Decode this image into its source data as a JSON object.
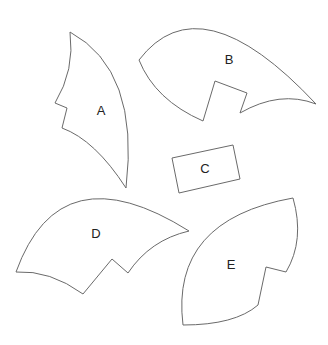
{
  "diagram": {
    "shapes": [
      {
        "id": "A",
        "label": "A",
        "label_pos": [
          101,
          110
        ]
      },
      {
        "id": "B",
        "label": "B",
        "label_pos": [
          229,
          59
        ]
      },
      {
        "id": "C",
        "label": "C",
        "label_pos": [
          205,
          168
        ]
      },
      {
        "id": "D",
        "label": "D",
        "label_pos": [
          96,
          233
        ]
      },
      {
        "id": "E",
        "label": "E",
        "label_pos": [
          231,
          264
        ]
      }
    ],
    "stroke_color": "#6a6a6a",
    "fill_color": "#ffffff"
  }
}
